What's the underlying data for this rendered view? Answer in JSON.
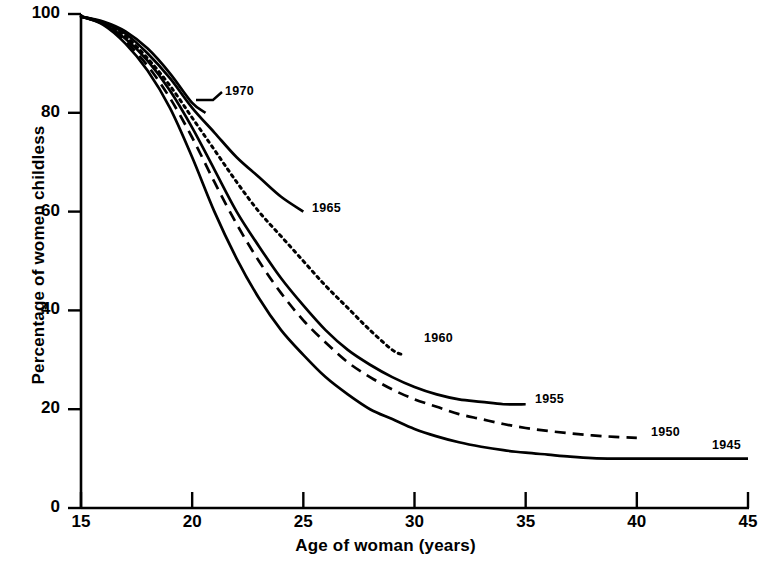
{
  "chart_data": {
    "type": "line",
    "title": "",
    "xlabel": "Age of woman (years)",
    "ylabel": "Percentage of women childless",
    "xlim": [
      15,
      45
    ],
    "ylim": [
      0,
      100
    ],
    "xticks": [
      15,
      20,
      25,
      30,
      35,
      40,
      45
    ],
    "yticks": [
      0,
      20,
      40,
      60,
      80,
      100
    ],
    "grid": false,
    "legend_position": "inline-end-of-line",
    "series": [
      {
        "name": "1970",
        "label": "1970",
        "style": "solid",
        "x": [
          15,
          16,
          17,
          18,
          19,
          20,
          20.6
        ],
        "values": [
          99.5,
          98.5,
          96.5,
          93,
          88,
          82,
          80
        ]
      },
      {
        "name": "1965",
        "label": "1965",
        "style": "solid",
        "x": [
          15,
          16,
          17,
          18,
          19,
          20,
          21,
          22,
          23,
          24,
          25
        ],
        "values": [
          99.5,
          98.3,
          96,
          92,
          87,
          81,
          76,
          71,
          67,
          63,
          60
        ]
      },
      {
        "name": "1960",
        "label": "1960",
        "style": "dotted",
        "x": [
          15,
          16,
          17,
          18,
          19,
          20,
          21,
          22,
          23,
          24,
          25,
          26,
          27,
          28,
          29,
          29.5
        ],
        "values": [
          99.5,
          98.2,
          95.5,
          91,
          85.5,
          79,
          72.5,
          66,
          60,
          55,
          50,
          45,
          40.5,
          36,
          32,
          31
        ]
      },
      {
        "name": "1955",
        "label": "1955",
        "style": "solid",
        "x": [
          15,
          16,
          17,
          18,
          19,
          20,
          21,
          22,
          23,
          24,
          25,
          26,
          27,
          28,
          29,
          30,
          31,
          32,
          33,
          34,
          35
        ],
        "values": [
          99.5,
          98,
          95,
          90.5,
          84.5,
          77,
          68.5,
          60,
          53,
          46.5,
          41,
          36,
          32,
          29,
          26.5,
          24.5,
          23,
          22,
          21.5,
          21,
          21
        ]
      },
      {
        "name": "1950",
        "label": "1950",
        "style": "dashed",
        "x": [
          15,
          16,
          17,
          18,
          19,
          20,
          21,
          22,
          23,
          24,
          25,
          26,
          27,
          28,
          29,
          30,
          31,
          32,
          33,
          34,
          35,
          36,
          37,
          38,
          39,
          40
        ],
        "values": [
          99.5,
          98,
          94.5,
          89.5,
          83,
          75,
          66,
          57.5,
          50,
          43.5,
          38,
          33.5,
          29.5,
          26.5,
          24,
          22,
          20.5,
          19,
          18,
          17,
          16.2,
          15.6,
          15.1,
          14.7,
          14.4,
          14.2
        ]
      },
      {
        "name": "1945",
        "label": "1945",
        "style": "solid",
        "x": [
          15,
          16,
          17,
          18,
          19,
          20,
          21,
          22,
          23,
          24,
          25,
          26,
          27,
          28,
          29,
          30,
          31,
          32,
          33,
          34,
          35,
          36,
          37,
          38,
          39,
          40,
          41,
          42,
          43,
          44,
          45
        ],
        "values": [
          99.5,
          97.8,
          94,
          88.5,
          81,
          71,
          60,
          50.5,
          42.5,
          36,
          31,
          26.5,
          23,
          20,
          18,
          16,
          14.5,
          13.3,
          12.4,
          11.7,
          11.2,
          10.8,
          10.4,
          10.1,
          10,
          10,
          10,
          10,
          10,
          10,
          10
        ]
      }
    ],
    "colors": {
      "axis": "#000000",
      "line": "#000000",
      "background": "#ffffff"
    }
  },
  "axes": {
    "x_title": "Age of woman (years)",
    "y_title": "Percentage of women childless",
    "x_tick_labels": [
      "15",
      "20",
      "25",
      "30",
      "35",
      "40",
      "45"
    ],
    "y_tick_labels": [
      "0",
      "20",
      "40",
      "60",
      "80",
      "100"
    ]
  },
  "series_labels": {
    "s1970": "1970",
    "s1965": "1965",
    "s1960": "1960",
    "s1955": "1955",
    "s1950": "1950",
    "s1945": "1945"
  }
}
